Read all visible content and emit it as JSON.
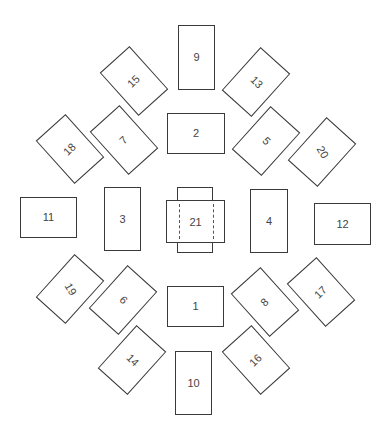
{
  "diagram": {
    "stroke_color": "#3a3a3a",
    "background": "#ffffff",
    "cards": [
      {
        "id": "1",
        "label": "1",
        "cx": 195.5,
        "cy": 306.5,
        "w": 57,
        "h": 41,
        "rot": 0,
        "text_rot": 0
      },
      {
        "id": "2",
        "label": "2",
        "cx": 196,
        "cy": 133.5,
        "w": 58,
        "h": 41,
        "rot": 0,
        "text_rot": 0
      },
      {
        "id": "3",
        "label": "3",
        "cx": 122.5,
        "cy": 219,
        "w": 37,
        "h": 64,
        "rot": 0,
        "text_rot": 0
      },
      {
        "id": "4",
        "label": "4",
        "cx": 269,
        "cy": 221,
        "w": 38,
        "h": 64,
        "rot": 0,
        "text_rot": 0
      },
      {
        "id": "5",
        "label": "5",
        "cx": 266,
        "cy": 141,
        "w": 58,
        "h": 40,
        "rot": -48,
        "text_rot": 45
      },
      {
        "id": "6",
        "label": "6",
        "cx": 123,
        "cy": 299.5,
        "w": 58,
        "h": 40,
        "rot": -48,
        "text_rot": 45
      },
      {
        "id": "7",
        "label": "7",
        "cx": 123.5,
        "cy": 140,
        "w": 58,
        "h": 40,
        "rot": 48,
        "text_rot": -45
      },
      {
        "id": "8",
        "label": "8",
        "cx": 265,
        "cy": 301.5,
        "w": 58,
        "h": 40,
        "rot": 48,
        "text_rot": -45
      },
      {
        "id": "9",
        "label": "9",
        "cx": 196.5,
        "cy": 57.5,
        "w": 37,
        "h": 65,
        "rot": 0,
        "text_rot": 0
      },
      {
        "id": "10",
        "label": "10",
        "cx": 193.5,
        "cy": 383,
        "w": 37,
        "h": 64,
        "rot": 0,
        "text_rot": 0
      },
      {
        "id": "11",
        "label": "11",
        "cx": 48.5,
        "cy": 217.5,
        "w": 57,
        "h": 41,
        "rot": 0,
        "text_rot": 0
      },
      {
        "id": "12",
        "label": "12",
        "cx": 342.5,
        "cy": 224,
        "w": 57,
        "h": 42,
        "rot": 0,
        "text_rot": 0
      },
      {
        "id": "13",
        "label": "13",
        "cx": 256,
        "cy": 81.5,
        "w": 58,
        "h": 40,
        "rot": -48,
        "text_rot": 45
      },
      {
        "id": "14",
        "label": "14",
        "cx": 132,
        "cy": 360,
        "w": 58,
        "h": 40,
        "rot": -48,
        "text_rot": 45
      },
      {
        "id": "15",
        "label": "15",
        "cx": 134,
        "cy": 80.5,
        "w": 58,
        "h": 40,
        "rot": 48,
        "text_rot": -45
      },
      {
        "id": "16",
        "label": "16",
        "cx": 256,
        "cy": 359.5,
        "w": 58,
        "h": 40,
        "rot": 48,
        "text_rot": -45
      },
      {
        "id": "17",
        "label": "17",
        "cx": 320.5,
        "cy": 292,
        "w": 58,
        "h": 40,
        "rot": 48,
        "text_rot": -45
      },
      {
        "id": "18",
        "label": "18",
        "cx": 70,
        "cy": 148.5,
        "w": 58,
        "h": 40,
        "rot": 48,
        "text_rot": -45
      },
      {
        "id": "19",
        "label": "19",
        "cx": 69.5,
        "cy": 289,
        "w": 58,
        "h": 40,
        "rot": -48,
        "text_rot": 60
      },
      {
        "id": "20",
        "label": "20",
        "cx": 322,
        "cy": 152,
        "w": 58,
        "h": 40,
        "rot": -48,
        "text_rot": 60
      }
    ],
    "center": {
      "label": "21",
      "vertical_card": {
        "x": 177,
        "y": 187,
        "w": 36,
        "h": 66
      },
      "horizontal_card": {
        "x": 166,
        "y": 200,
        "w": 59,
        "h": 43
      },
      "dashed_lines_x": [
        178,
        212
      ]
    }
  }
}
